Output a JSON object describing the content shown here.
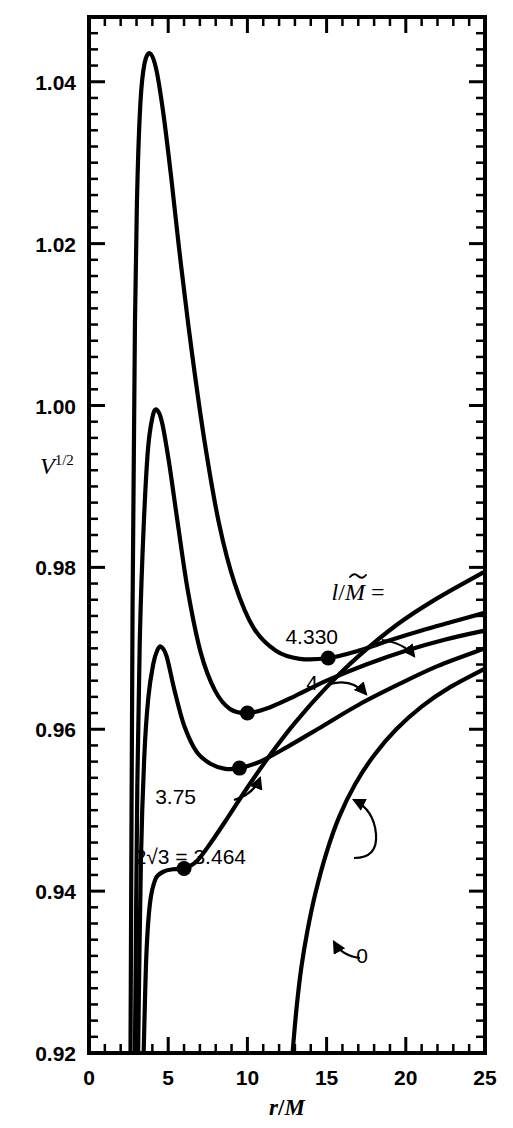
{
  "chart_data": {
    "type": "line",
    "title": "",
    "xlabel": "r/M",
    "ylabel": "V^1/2",
    "ylabel_base": "V",
    "ylabel_exponent": "1/2",
    "xlim": [
      0,
      25
    ],
    "ylim": [
      0.92,
      1.048
    ],
    "grid": false,
    "legend_position": "inline-annotations",
    "legend_title": "l/M =",
    "legend_title_parts": {
      "symbol": "l",
      "tilde": true,
      "over": "M",
      "equals": "="
    },
    "x_ticks_major": [
      0,
      5,
      10,
      15,
      20,
      25
    ],
    "x_ticks_major_labels": [
      "0",
      "5",
      "10",
      "15",
      "20",
      "25"
    ],
    "x_tick_minor_step": 1,
    "y_ticks_major": [
      0.92,
      0.94,
      0.96,
      0.98,
      1.0,
      1.02,
      1.04
    ],
    "y_ticks_major_labels": [
      "0.92",
      "0.94",
      "0.96",
      "0.98",
      "1.00",
      "1.02",
      "1.04"
    ],
    "y_tick_minor_step": 0.002,
    "series": [
      {
        "name": "4.330",
        "label": "4.330",
        "annotation": "4.330",
        "marker_point": {
          "x": 15.1,
          "y": 0.9688,
          "type": "filled-circle"
        },
        "peak": {
          "x": 3.85,
          "y": 1.0435
        },
        "points": [
          [
            2.62,
            0.92
          ],
          [
            2.75,
            0.975
          ],
          [
            2.9,
            1.01
          ],
          [
            3.05,
            1.027
          ],
          [
            3.25,
            1.0375
          ],
          [
            3.5,
            1.0422
          ],
          [
            3.85,
            1.0435
          ],
          [
            4.25,
            1.0415
          ],
          [
            4.7,
            1.036
          ],
          [
            5.2,
            1.028
          ],
          [
            5.8,
            1.0175
          ],
          [
            6.5,
            1.0065
          ],
          [
            7.3,
            0.9955
          ],
          [
            8.2,
            0.9855
          ],
          [
            9.2,
            0.978
          ],
          [
            10.4,
            0.9725
          ],
          [
            11.8,
            0.9697
          ],
          [
            13.3,
            0.9687
          ],
          [
            15.1,
            0.9688
          ],
          [
            17.0,
            0.9697
          ],
          [
            19.0,
            0.971
          ],
          [
            21.0,
            0.9722
          ],
          [
            23.0,
            0.9733
          ],
          [
            25.0,
            0.9744
          ]
        ]
      },
      {
        "name": "4",
        "label": "4",
        "annotation": "4",
        "marker_point": {
          "x": 10.0,
          "y": 0.962,
          "type": "filled-circle"
        },
        "peak": {
          "x": 4.25,
          "y": 0.9995
        },
        "points": [
          [
            2.9,
            0.92
          ],
          [
            3.05,
            0.953
          ],
          [
            3.22,
            0.972
          ],
          [
            3.45,
            0.985
          ],
          [
            3.72,
            0.9945
          ],
          [
            4.0,
            0.9985
          ],
          [
            4.25,
            0.9995
          ],
          [
            4.6,
            0.998
          ],
          [
            5.05,
            0.993
          ],
          [
            5.6,
            0.9855
          ],
          [
            6.25,
            0.977
          ],
          [
            7.05,
            0.9695
          ],
          [
            7.95,
            0.9648
          ],
          [
            8.9,
            0.9625
          ],
          [
            10.0,
            0.962
          ],
          [
            11.4,
            0.9627
          ],
          [
            13.0,
            0.9641
          ],
          [
            15.0,
            0.966
          ],
          [
            17.5,
            0.968
          ],
          [
            20.0,
            0.9697
          ],
          [
            22.5,
            0.9711
          ],
          [
            25.0,
            0.9722
          ]
        ]
      },
      {
        "name": "3.75",
        "label": "3.75",
        "annotation": "3.75",
        "marker_point": {
          "x": 9.5,
          "y": 0.9552,
          "type": "filled-circle"
        },
        "peak": {
          "x": 4.55,
          "y": 0.9702
        },
        "points": [
          [
            3.1,
            0.92
          ],
          [
            3.28,
            0.944
          ],
          [
            3.5,
            0.957
          ],
          [
            3.75,
            0.964
          ],
          [
            4.05,
            0.968
          ],
          [
            4.3,
            0.9697
          ],
          [
            4.55,
            0.9702
          ],
          [
            4.9,
            0.969
          ],
          [
            5.4,
            0.9648
          ],
          [
            6.0,
            0.9605
          ],
          [
            6.8,
            0.9572
          ],
          [
            7.7,
            0.9557
          ],
          [
            8.6,
            0.9551
          ],
          [
            9.5,
            0.9552
          ],
          [
            10.8,
            0.956
          ],
          [
            12.5,
            0.9578
          ],
          [
            14.5,
            0.9601
          ],
          [
            17.0,
            0.963
          ],
          [
            19.5,
            0.9655
          ],
          [
            22.0,
            0.9678
          ],
          [
            25.0,
            0.97
          ]
        ]
      },
      {
        "name": "2sqrt3",
        "label": "2√3 = 3.464",
        "annotation": "2√3 = 3.464",
        "marker_point": {
          "x": 6.0,
          "y": 0.9428,
          "type": "filled-circle"
        },
        "inflection": {
          "x": 6.0,
          "y": 0.9428
        },
        "points": [
          [
            3.45,
            0.92
          ],
          [
            3.62,
            0.932
          ],
          [
            3.85,
            0.9385
          ],
          [
            4.2,
            0.9415
          ],
          [
            4.7,
            0.9424
          ],
          [
            5.3,
            0.9427
          ],
          [
            6.0,
            0.9428
          ],
          [
            6.8,
            0.9437
          ],
          [
            7.7,
            0.946
          ],
          [
            8.8,
            0.9492
          ],
          [
            10.0,
            0.9528
          ],
          [
            11.5,
            0.957
          ],
          [
            13.0,
            0.9608
          ],
          [
            15.0,
            0.9652
          ],
          [
            17.0,
            0.969
          ],
          [
            19.5,
            0.973
          ],
          [
            22.0,
            0.9762
          ],
          [
            25.0,
            0.9795
          ]
        ]
      },
      {
        "name": "0",
        "label": "0",
        "annotation": "0",
        "marker_point": null,
        "points": [
          [
            12.85,
            0.92
          ],
          [
            13.1,
            0.9255
          ],
          [
            13.4,
            0.9305
          ],
          [
            13.8,
            0.9352
          ],
          [
            14.3,
            0.9398
          ],
          [
            15.0,
            0.9448
          ],
          [
            15.8,
            0.9492
          ],
          [
            16.8,
            0.9532
          ],
          [
            18.0,
            0.9568
          ],
          [
            19.4,
            0.96
          ],
          [
            21.0,
            0.9628
          ],
          [
            22.8,
            0.9652
          ],
          [
            25.0,
            0.9675
          ]
        ]
      }
    ],
    "annotations": [
      {
        "text": "l/M =",
        "kind": "legend-title",
        "x_px": 358,
        "y_px": 596
      },
      {
        "text": "4.330",
        "kind": "curve-label",
        "x_px": 338,
        "y_px": 644
      },
      {
        "text": "4",
        "kind": "curve-label",
        "x_px": 318,
        "y_px": 690
      },
      {
        "text": "3.75",
        "kind": "curve-label",
        "x_px": 196,
        "y_px": 804
      },
      {
        "text": "2√3 = 3.464",
        "kind": "curve-label",
        "x_px": 246,
        "y_px": 864
      },
      {
        "text": "0",
        "kind": "curve-label",
        "x_px": 368,
        "y_px": 963
      }
    ]
  }
}
